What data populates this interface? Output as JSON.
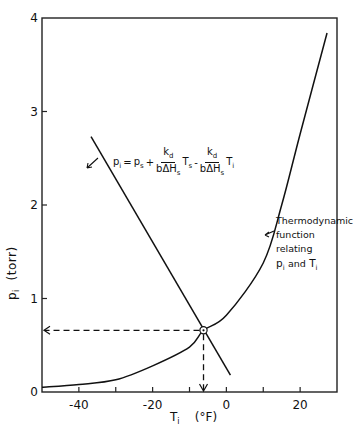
{
  "chart_data": {
    "type": "line",
    "title": "",
    "xlabel": "T_i (°F)",
    "ylabel": "p_i (torr)",
    "xlim": [
      -50,
      30
    ],
    "ylim": [
      0,
      4
    ],
    "x_ticks": [
      -40,
      -30,
      -20,
      -10,
      0,
      10,
      20
    ],
    "x_tick_labels": [
      "-40",
      "",
      "-20",
      "",
      "0",
      "",
      "20"
    ],
    "y_ticks": [
      0,
      1,
      2,
      3,
      4
    ],
    "y_tick_labels": [
      "0",
      "1",
      "2",
      "3",
      "4"
    ],
    "grid": false,
    "legend": "none",
    "series": [
      {
        "name": "Thermodynamic function relating p_i and T_i",
        "style": "solid-curve",
        "x": [
          -50,
          -40,
          -30,
          -20,
          -10,
          -6.2,
          0,
          10,
          15,
          20,
          27.3
        ],
        "y": [
          0.05,
          0.08,
          0.13,
          0.28,
          0.48,
          0.66,
          0.82,
          1.38,
          2.0,
          2.76,
          3.84
        ]
      },
      {
        "name": "Operating line",
        "style": "solid-line",
        "x": [
          -36.7,
          1.1
        ],
        "y": [
          2.73,
          0.18
        ]
      }
    ],
    "intersection": {
      "x": -6.2,
      "y": 0.66,
      "marker": "circle-dot"
    },
    "guides": [
      {
        "from": [
          -6.2,
          0.66
        ],
        "to": [
          -50,
          0.66
        ],
        "style": "dashed-arrow"
      },
      {
        "from": [
          -6.2,
          0.66
        ],
        "to": [
          -6.2,
          0
        ],
        "style": "dashed-arrow"
      }
    ],
    "annotations": [
      {
        "text": "p_i = p_s + k_d/(bΔH_s) T_s - k_d/(bΔH_s) T_i",
        "points_to": "operating line"
      },
      {
        "text": "Thermodynamic function relating p_i and T_i",
        "points_to": "curve"
      }
    ]
  },
  "axes": {
    "xlabel_main": "T",
    "xlabel_sub": "i",
    "xlabel_unit": "(°F)",
    "ylabel_main": "p",
    "ylabel_sub": "i",
    "ylabel_unit": "(torr)"
  },
  "equation": {
    "lhs": "p",
    "lhs_sub": "i",
    "eq": "=",
    "ps": "p",
    "ps_sub": "s",
    "plus": "+",
    "num": "k",
    "num_sub": "d",
    "den": "bΔH",
    "den_sub": "s",
    "ts": "T",
    "ts_sub": "s",
    "minus": "-",
    "ti": "T",
    "ti_sub": "i"
  },
  "curve_label": {
    "line1": "Thermodynamic",
    "line2": "function",
    "line3": "relating",
    "line4_p": "p",
    "line4_sub1": "i",
    "line4_and": "and",
    "line4_t": "T",
    "line4_sub2": "i"
  }
}
